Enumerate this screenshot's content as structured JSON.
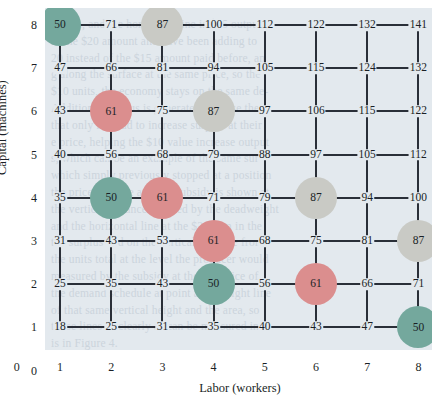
{
  "chart_data": {
    "type": "heatmap",
    "title": "",
    "xlabel": "Labor (workers)",
    "ylabel": "Capital (machines)",
    "x": [
      1,
      2,
      3,
      4,
      5,
      6,
      7,
      8
    ],
    "y": [
      1,
      2,
      3,
      4,
      5,
      6,
      7,
      8
    ],
    "xtick_labels": [
      "0",
      "1",
      "2",
      "3",
      "4",
      "5",
      "6",
      "7",
      "8"
    ],
    "ytick_labels": [
      "0",
      "1",
      "2",
      "3",
      "4",
      "5",
      "6",
      "7",
      "8"
    ],
    "xlim": [
      0,
      8
    ],
    "ylim": [
      0,
      8
    ],
    "grid": true,
    "legend": "none",
    "value_label": "Output (units)",
    "rows": [
      {
        "capital": 8,
        "values": [
          50,
          71,
          87,
          100,
          112,
          122,
          132,
          141
        ]
      },
      {
        "capital": 7,
        "values": [
          47,
          66,
          81,
          94,
          105,
          115,
          124,
          132
        ]
      },
      {
        "capital": 6,
        "values": [
          43,
          61,
          75,
          87,
          97,
          106,
          115,
          122
        ]
      },
      {
        "capital": 5,
        "values": [
          40,
          56,
          68,
          79,
          88,
          97,
          105,
          112
        ]
      },
      {
        "capital": 4,
        "values": [
          35,
          50,
          61,
          71,
          79,
          87,
          94,
          100
        ]
      },
      {
        "capital": 3,
        "values": [
          31,
          43,
          53,
          61,
          68,
          75,
          81,
          87
        ]
      },
      {
        "capital": 2,
        "values": [
          25,
          35,
          43,
          50,
          56,
          61,
          66,
          71
        ]
      },
      {
        "capital": 1,
        "values": [
          18,
          25,
          31,
          35,
          40,
          43,
          47,
          50
        ]
      }
    ],
    "highlighted": [
      {
        "labor": 1,
        "capital": 8,
        "value": 50,
        "group": "isoquant-50"
      },
      {
        "labor": 3,
        "capital": 8,
        "value": 87,
        "group": "isoquant-87"
      },
      {
        "labor": 2,
        "capital": 6,
        "value": 61,
        "group": "isoquant-61"
      },
      {
        "labor": 4,
        "capital": 6,
        "value": 87,
        "group": "isoquant-87"
      },
      {
        "labor": 2,
        "capital": 4,
        "value": 50,
        "group": "isoquant-50"
      },
      {
        "labor": 3,
        "capital": 4,
        "value": 61,
        "group": "isoquant-61"
      },
      {
        "labor": 6,
        "capital": 4,
        "value": 87,
        "group": "isoquant-87"
      },
      {
        "labor": 4,
        "capital": 3,
        "value": 61,
        "group": "isoquant-61"
      },
      {
        "labor": 8,
        "capital": 3,
        "value": 87,
        "group": "isoquant-87"
      },
      {
        "labor": 4,
        "capital": 2,
        "value": 50,
        "group": "isoquant-50"
      },
      {
        "labor": 6,
        "capital": 2,
        "value": 61,
        "group": "isoquant-61"
      },
      {
        "labor": 8,
        "capital": 1,
        "value": 50,
        "group": "isoquant-50"
      }
    ],
    "marker_colors": {
      "isoquant-50": "#74a89d",
      "isoquant-61": "#db8e8e",
      "isoquant-87": "#c9cac5"
    },
    "panel_color": "#e3e9ee",
    "line_color": "#2a2f38"
  },
  "bleed_text": [
    "shown, and the horizontal line is $15 output",
    "to the $20 amount and have been adding to",
    "20 instead of the $15 amount paid before, an",
    "g along the surface at the same price, so the",
    "$10 units, the economy stays on the same de-",
    "Additional surplus is generated because the",
    "that only has had to increase surplus at their",
    "e price, helping the $10 value increase output",
    "s, which can be an example of the same sur-",
    "which simply previously stopped at a position",
    "the price, and the amount subsidy is shown at",
    "the vertical distance covered by the deadweight",
    "and the horizontal line at the $20 sum in the",
    "the surplus and on the vertical distance from",
    "the units total at the level the producer would",
    "measured by the subsidy at the full price of",
    "the demand schedule at point at a straight line",
    "of that same vertical height and the area, so",
    "those lines as clearly as can be measured in",
    "is in Figure 4."
  ],
  "axis": {
    "x_label": "Labor (workers)",
    "y_label": "Capital (machines)",
    "x_ticks": [
      "0",
      "1",
      "2",
      "3",
      "4",
      "5",
      "6",
      "7",
      "8"
    ],
    "y_ticks": [
      "0",
      "1",
      "2",
      "3",
      "4",
      "5",
      "6",
      "7",
      "8"
    ]
  }
}
